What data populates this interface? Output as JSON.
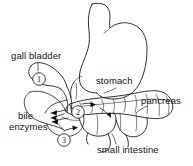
{
  "diagram": {
    "background_color": "#ffffff",
    "line_color": "#1a1a1a",
    "labels": {
      "gall_bladder": "gall bladder",
      "stomach": "stomach",
      "pancreas": "pancreas",
      "bile": "bile",
      "enzymes": "enzymes",
      "small_intestine": "small intestine"
    },
    "markers": [
      {
        "id": "marker-1",
        "number": "1"
      },
      {
        "id": "marker-2",
        "number": "2"
      },
      {
        "id": "marker-3",
        "number": "3"
      }
    ]
  }
}
